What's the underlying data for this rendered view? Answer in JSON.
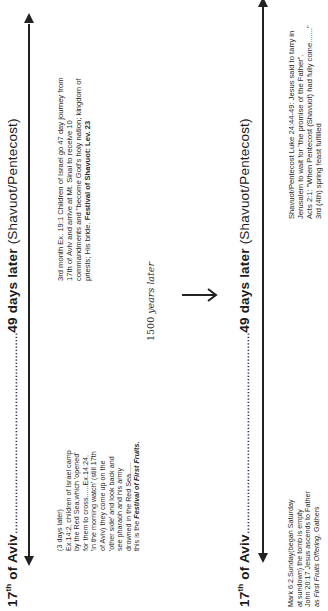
{
  "top_panel": {
    "start_label": "17th of Aviv",
    "start_label_base": "17",
    "start_label_sup": "th",
    "start_label_rest": " of Aviv",
    "dots": "..............................................................",
    "end_label_bold": "49 days later",
    "end_label_plain": " (Shavuot/Pentecost)",
    "left_note": [
      "(3 days later)",
      "Ex.14:2, children of Israel camp",
      "by the Red Sea,which 'opened'",
      "for them to cross......Ex.14:24,",
      "'in the morning watch' (still 17th",
      "of Aviv) they come up on the",
      "'other side' and look back and",
      "see pharaoh and his army",
      "drowned in the Red Sea......"
    ],
    "left_note_last_prefix": "this is the ",
    "left_note_last_emph": "Festival of First Fruits.",
    "right_note": [
      "3rd month Ex. 19:1 Children of Israel go 47 day journey from",
      "17th of Aviv and arrive at Mt. Sinai to receive 10",
      "commandments and \"become God's holy nation; kingdom of"
    ],
    "right_note_last_prefix": "priests; His bride. ",
    "right_note_last_emph": "Festival of Shavuot: Lev. 23"
  },
  "transition": {
    "years_number": "1500",
    "years_text": "years later",
    "arrow_icon": "right-arrow"
  },
  "bottom_panel": {
    "start_label_base": "17",
    "start_label_sup": "th",
    "start_label_rest": " of Aviv",
    "dots": "..............................................................",
    "end_label_bold": "49 days later",
    "end_label_plain": " (Shavuot/Pentecost)",
    "left_note": [
      "Mark 6:2,Sunday(began Saturday",
      "at sundown) the tomb is empty",
      "John 20:17 Jesus ascends to Father"
    ],
    "left_note_last_prefix": "as ",
    "left_note_last_emph": "First Fruits Offering",
    "left_note_last_suffix": ", Gathers",
    "right_note": [
      "Shavuot/Pentecost  Luke 24:44-49: Jesus said to tarry in",
      "Jerusalem to wait for \"the promise of the Father\".",
      "Acts 2:1: \"When Pentecost (Shavuot) had fully come.......\"",
      "3rd (4th) spring feast fulfilled"
    ]
  }
}
